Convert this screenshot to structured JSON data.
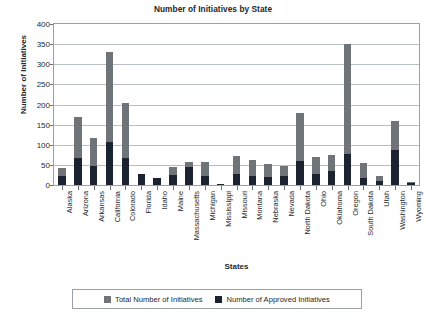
{
  "chart_data": {
    "type": "bar",
    "title": "Number of Initiatives by State",
    "xlabel": "States",
    "ylabel": "Number of Initiatives",
    "ylim": [
      0,
      400
    ],
    "yticks": [
      0,
      50,
      100,
      150,
      200,
      250,
      300,
      350,
      400
    ],
    "grid": true,
    "legend_position": "bottom",
    "stacked": true,
    "categories": [
      "Alaska",
      "Arizona",
      "Arkansas",
      "California",
      "Colorado",
      "Florida",
      "Idaho",
      "Maine",
      "Massachusetts",
      "Michigan",
      "Mississippi",
      "Missouri",
      "Montana",
      "Nebraska",
      "Nevada",
      "North Dakota",
      "Ohio",
      "Oklahoma",
      "Oregon",
      "South Dakota",
      "Utah",
      "Washington",
      "Wyoming"
    ],
    "series": [
      {
        "name": "Total Number of Initiatives",
        "color": "#6f7479",
        "values": [
          42,
          170,
          118,
          330,
          205,
          27,
          18,
          45,
          57,
          57,
          3,
          72,
          62,
          52,
          48,
          178,
          70,
          75,
          350,
          55,
          22,
          158,
          8
        ]
      },
      {
        "name": "Number of Approved Initiatives",
        "color": "#1b2330",
        "values": [
          23,
          67,
          48,
          108,
          68,
          27,
          18,
          25,
          45,
          22,
          2,
          28,
          22,
          20,
          22,
          60,
          28,
          35,
          78,
          18,
          10,
          87,
          5
        ]
      }
    ]
  },
  "legend": {
    "items": [
      {
        "label": "Total Number of Initiatives"
      },
      {
        "label": "Number of Approved Initiatives"
      }
    ]
  }
}
